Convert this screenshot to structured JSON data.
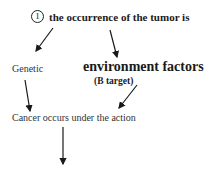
{
  "diagram": {
    "title": {
      "marker": "1",
      "text": "the occurrence of the tumor is"
    },
    "nodes": {
      "genetic": "Genetic",
      "environment": "environment factors",
      "b_target": "(B target)",
      "cancer": "Cancer occurs  under the action"
    },
    "arrows": [
      {
        "from": "title",
        "to": "genetic"
      },
      {
        "from": "title",
        "to": "environment"
      },
      {
        "from": "genetic",
        "to": "cancer"
      },
      {
        "from": "b_target",
        "to": "cancer"
      },
      {
        "from": "cancer",
        "to": "below"
      }
    ],
    "colors": {
      "text": "#1a1a1a",
      "background": "#ffffff"
    }
  }
}
